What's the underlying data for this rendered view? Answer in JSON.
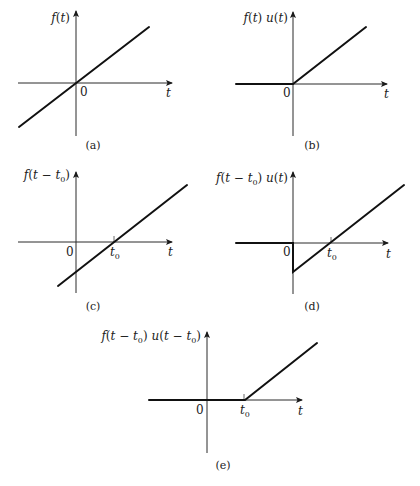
{
  "figure": {
    "panels": [
      {
        "id": "a",
        "caption": "(a)",
        "ylabel": {
          "parts": [
            [
              "f",
              "it"
            ],
            [
              "(",
              "n"
            ],
            [
              "t",
              "it"
            ],
            [
              ")",
              "n"
            ]
          ]
        },
        "origin_label": "0",
        "xlabel": "t",
        "t0_label": null,
        "description": "Ramp f(t) through the origin, defined for all t"
      },
      {
        "id": "b",
        "caption": "(b)",
        "ylabel": {
          "parts": [
            [
              "f",
              "it"
            ],
            [
              "(",
              "n"
            ],
            [
              "t",
              "it"
            ],
            [
              ") ",
              "n"
            ],
            [
              "u",
              "it"
            ],
            [
              "(",
              "n"
            ],
            [
              "t",
              "it"
            ],
            [
              ")",
              "n"
            ]
          ]
        },
        "origin_label": "0",
        "xlabel": "t",
        "t0_label": null,
        "description": "f(t) multiplied by unit step: zero for t<0, ramp for t>=0"
      },
      {
        "id": "c",
        "caption": "(c)",
        "ylabel": {
          "parts": [
            [
              "f",
              "it"
            ],
            [
              "(",
              "n"
            ],
            [
              "t",
              "it"
            ],
            [
              " − ",
              "n"
            ],
            [
              "t",
              "it"
            ],
            [
              "0",
              "sub"
            ],
            [
              ")",
              "n"
            ]
          ]
        },
        "origin_label": "0",
        "xlabel": "t",
        "t0_label": "t0",
        "description": "Ramp shifted right by t0, crossing zero at t0"
      },
      {
        "id": "d",
        "caption": "(d)",
        "ylabel": {
          "parts": [
            [
              "f",
              "it"
            ],
            [
              "(",
              "n"
            ],
            [
              "t",
              "it"
            ],
            [
              " − ",
              "n"
            ],
            [
              "t",
              "it"
            ],
            [
              "0",
              "sub"
            ],
            [
              ") ",
              "n"
            ],
            [
              "u",
              "it"
            ],
            [
              "(",
              "n"
            ],
            [
              "t",
              "it"
            ],
            [
              ")",
              "n"
            ]
          ]
        },
        "origin_label": "0",
        "xlabel": "t",
        "t0_label": "t0",
        "description": "Shifted ramp truncated at t=0: jumps to negative value at 0 then rises through t0"
      },
      {
        "id": "e",
        "caption": "(e)",
        "ylabel": {
          "parts": [
            [
              "f",
              "it"
            ],
            [
              "(",
              "n"
            ],
            [
              "t",
              "it"
            ],
            [
              " − ",
              "n"
            ],
            [
              "t",
              "it"
            ],
            [
              "0",
              "sub"
            ],
            [
              ") ",
              "n"
            ],
            [
              "u",
              "it"
            ],
            [
              "(",
              "n"
            ],
            [
              "t",
              "it"
            ],
            [
              " − ",
              "n"
            ],
            [
              "t",
              "it"
            ],
            [
              "0",
              "sub"
            ],
            [
              ")",
              "n"
            ]
          ]
        },
        "origin_label": "0",
        "xlabel": "t",
        "t0_label": "t0",
        "description": "Shifted ramp with shifted step: zero until t0, then ramp"
      }
    ]
  },
  "chart_data": [
    {
      "type": "line",
      "title": "(a) f(t)",
      "xlabel": "t",
      "ylabel": "f(t)",
      "x": [
        -1.0,
        0,
        1.4
      ],
      "y": [
        -0.78,
        0,
        1.0
      ],
      "annotations": [
        "0"
      ]
    },
    {
      "type": "line",
      "title": "(b) f(t) u(t)",
      "xlabel": "t",
      "ylabel": "f(t) u(t)",
      "x": [
        -1.0,
        0,
        1.4
      ],
      "y": [
        0,
        0,
        1.0
      ],
      "annotations": [
        "0"
      ]
    },
    {
      "type": "line",
      "title": "(c) f(t - t0)",
      "xlabel": "t",
      "ylabel": "f(t - t0)",
      "x": [
        -0.35,
        0,
        0.7,
        1.9
      ],
      "y": [
        -0.78,
        -0.5,
        0,
        1.0
      ],
      "annotations": [
        "0",
        "t0"
      ]
    },
    {
      "type": "line",
      "title": "(d) f(t - t0) u(t)",
      "xlabel": "t",
      "ylabel": "f(t - t0) u(t)",
      "x": [
        -1.0,
        0,
        0,
        0.7,
        1.9
      ],
      "y": [
        0,
        0,
        -0.5,
        0,
        1.0
      ],
      "annotations": [
        "0",
        "t0"
      ]
    },
    {
      "type": "line",
      "title": "(e) f(t - t0) u(t - t0)",
      "xlabel": "t",
      "ylabel": "f(t - t0) u(t - t0)",
      "x": [
        -1.0,
        0,
        0.7,
        1.9
      ],
      "y": [
        0,
        0,
        0,
        1.0
      ],
      "annotations": [
        "0",
        "t0"
      ]
    }
  ]
}
